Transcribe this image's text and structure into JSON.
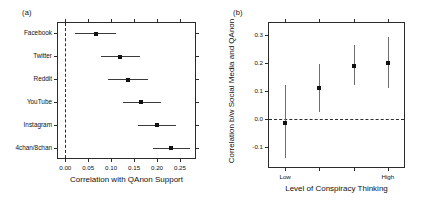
{
  "figure": {
    "panel_a_label": "(a)",
    "panel_b_label": "(b)"
  },
  "chart_data": [
    {
      "type": "scatter",
      "panel": "(a)",
      "title": "",
      "xlabel": "Correlation with QAnon Support",
      "ylabel": "",
      "xlim": [
        -0.018,
        0.285
      ],
      "xticks": [
        0.0,
        0.05,
        0.1,
        0.15,
        0.2,
        0.25
      ],
      "xticklabels": [
        "0.00",
        "0.05",
        "0.10",
        "0.15",
        "0.20",
        "0.25"
      ],
      "grid": false,
      "legend": "none",
      "reference_line": 0.0,
      "orientation": "horizontal",
      "categories": [
        "Facebook",
        "Twitter",
        "Reddit",
        "YouTube",
        "Instagram",
        "4chan/8chan"
      ],
      "values": [
        0.066,
        0.12,
        0.137,
        0.166,
        0.2,
        0.231
      ],
      "ci_low": [
        0.022,
        0.077,
        0.094,
        0.126,
        0.158,
        0.192
      ],
      "ci_high": [
        0.11,
        0.164,
        0.18,
        0.208,
        0.242,
        0.272
      ]
    },
    {
      "type": "scatter",
      "panel": "(b)",
      "title": "",
      "xlabel": "Level of Conspiracy Thinking",
      "ylabel": "Correlation b/w Social Media and QAnon",
      "ylim": [
        -0.175,
        0.345
      ],
      "yticks": [
        -0.1,
        0.0,
        0.1,
        0.2,
        0.3
      ],
      "yticklabels": [
        "-0.1",
        "0.0",
        "0.1",
        "0.2",
        "0.3"
      ],
      "xticks": [
        1,
        2,
        3,
        4
      ],
      "xticklabels": [
        "Low",
        "",
        "",
        "High"
      ],
      "grid": false,
      "legend": "none",
      "reference_line": 0.0,
      "orientation": "vertical",
      "categories": [
        "Low",
        "2",
        "3",
        "High"
      ],
      "values": [
        -0.013,
        0.11,
        0.19,
        0.2
      ],
      "ci_low": [
        -0.14,
        0.025,
        0.122,
        0.11
      ],
      "ci_high": [
        0.12,
        0.195,
        0.262,
        0.29
      ]
    }
  ]
}
